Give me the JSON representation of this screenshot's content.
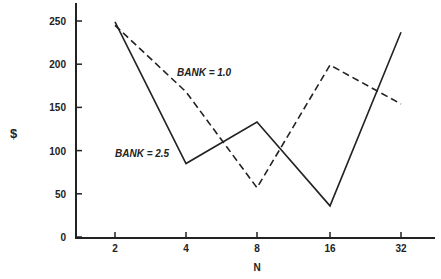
{
  "chart_data": {
    "type": "line",
    "title": "",
    "xlabel": "N",
    "ylabel": "$",
    "categories": [
      "2",
      "4",
      "8",
      "16",
      "32"
    ],
    "series": [
      {
        "name": "BANK = 1.0",
        "style": "dashed",
        "values": [
          245,
          168,
          57,
          199,
          154
        ]
      },
      {
        "name": "BANK = 2.5",
        "style": "solid",
        "values": [
          249,
          85,
          133,
          36,
          237
        ]
      }
    ],
    "ylim": [
      0,
      270
    ],
    "yticks": [
      0,
      50,
      100,
      150,
      200,
      250
    ],
    "grid": false,
    "legend": "inline annotations"
  },
  "labels": {
    "y_axis": "$",
    "x_axis": "N",
    "annotation_bank1": "BANK = 1.0",
    "annotation_bank2": "BANK = 2.5",
    "yticks": [
      "250",
      "200",
      "150",
      "100",
      "50",
      "0"
    ],
    "xticks": [
      "2",
      "4",
      "8",
      "16",
      "32"
    ]
  }
}
